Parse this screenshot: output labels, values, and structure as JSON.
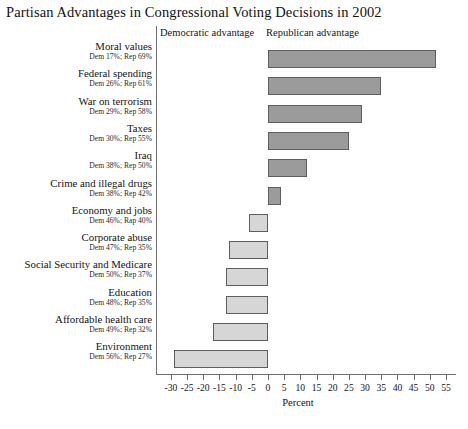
{
  "chart_data": {
    "type": "bar",
    "orientation": "horizontal",
    "title": "Partisan Advantages in Congressional Voting Decisions in 2002",
    "xlabel": "Percent",
    "ylabel": "",
    "xlim": [
      -32,
      57
    ],
    "xticks": [
      -30,
      -25,
      -20,
      -15,
      -10,
      -5,
      0,
      5,
      10,
      15,
      20,
      25,
      30,
      35,
      40,
      45,
      50,
      55
    ],
    "xticklabels": [
      "-30",
      "-25",
      "-20",
      "-15",
      "-10",
      "-5",
      "0",
      "5",
      "10",
      "15",
      "20",
      "25",
      "30",
      "35",
      "40",
      "45",
      "50",
      "55"
    ],
    "grid": false,
    "legend": false,
    "annotations": {
      "left_region": "Democratic advantage",
      "right_region": "Republican advantage"
    },
    "categories": [
      "Moral values",
      "Federal spending",
      "War on terrorism",
      "Taxes",
      "Iraq",
      "Crime and illegal drugs",
      "Economy and jobs",
      "Corporate abuse",
      "Social Security and Medicare",
      "Education",
      "Affordable health care",
      "Environment"
    ],
    "sublabels": [
      "Dem 17%; Rep 69%",
      "Dem 26%; Rep 61%",
      "Dem 29%; Rep 58%",
      "Dem 30%; Rep 55%",
      "Dem 38%; Rep 50%",
      "Dem 38%; Rep 42%",
      "Dem 46%; Rap 40%",
      "Dem 47%; Rep 35%",
      "Dem 50%; Rep 37%",
      "Dem 48%; Rep 35%",
      "Dem 49%; Rep 32%",
      "Dem 56%; Rep 27%"
    ],
    "values": [
      52,
      35,
      29,
      25,
      12,
      4,
      -6,
      -12,
      -13,
      -13,
      -17,
      -29
    ],
    "dem_percent": [
      17,
      26,
      29,
      30,
      38,
      38,
      46,
      47,
      50,
      48,
      49,
      56
    ],
    "rep_percent": [
      69,
      61,
      58,
      55,
      50,
      42,
      40,
      35,
      37,
      35,
      32,
      27
    ]
  },
  "colors": {
    "positive_bar": "#9b9b9b",
    "negative_bar": "#d6d6d6",
    "bar_border": "#5e5e5e",
    "axis": "#6e6e6e",
    "text": "#141414",
    "background": "#ffffff"
  }
}
